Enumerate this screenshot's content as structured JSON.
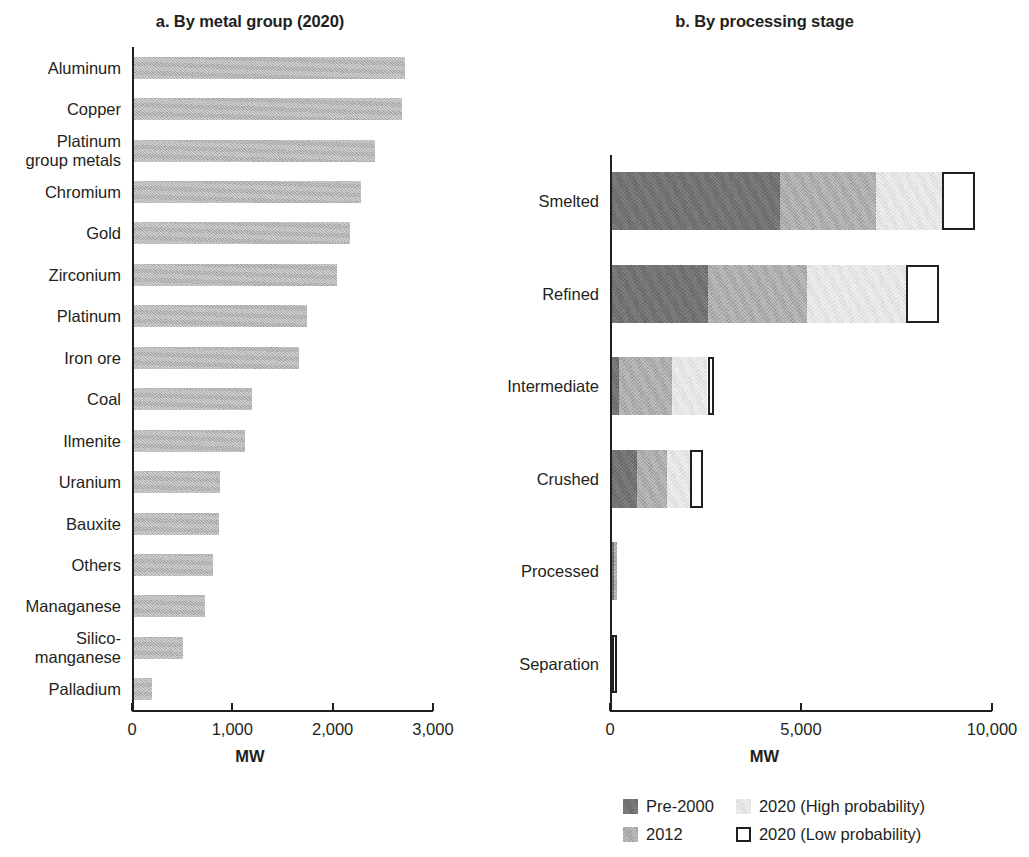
{
  "chart_data": [
    {
      "type": "bar",
      "panel": "a",
      "title": "a. By metal group (2020)",
      "orientation": "horizontal",
      "xlabel": "MW",
      "ylabel": "",
      "xlim": [
        0,
        3000
      ],
      "xticks": [
        0,
        1000,
        2000,
        3000
      ],
      "xticklabels": [
        "0",
        "1,000",
        "2,000",
        "3,000"
      ],
      "grid": false,
      "legend": "none",
      "categories": [
        "Aluminum",
        "Copper",
        "Platinum\ngroup metals",
        "Chromium",
        "Gold",
        "Zirconium",
        "Platinum",
        "Iron ore",
        "Coal",
        "Ilmenite",
        "Uranium",
        "Bauxite",
        "Others",
        "Managanese",
        "Silico-\nmanganese",
        "Palladium"
      ],
      "values": [
        2700,
        2670,
        2400,
        2260,
        2150,
        2020,
        1720,
        1640,
        1180,
        1110,
        860,
        850,
        790,
        710,
        490,
        180
      ],
      "series_color": "#b0b0b0"
    },
    {
      "type": "bar",
      "panel": "b",
      "title": "b. By processing stage",
      "orientation": "horizontal",
      "stacked": true,
      "xlabel": "MW",
      "ylabel": "",
      "xlim": [
        0,
        10000
      ],
      "xticks": [
        0,
        5000,
        10000
      ],
      "xticklabels": [
        "0",
        "5,000",
        "10,000"
      ],
      "grid": false,
      "legend_position": "bottom",
      "categories": [
        "Smelted",
        "Refined",
        "Intermediate",
        "Crushed",
        "Processed",
        "Separation"
      ],
      "series": [
        {
          "name": "Pre-2000",
          "color": "#6d6d6d",
          "values": [
            4400,
            2500,
            180,
            650,
            60,
            0
          ]
        },
        {
          "name": "2012",
          "color": "#a8a8a8",
          "values": [
            2500,
            2600,
            1400,
            800,
            70,
            0
          ]
        },
        {
          "name": "2020 (High probability)",
          "color": "#e2e2e2",
          "values": [
            1750,
            2600,
            920,
            580,
            0,
            0
          ]
        },
        {
          "name": "2020 (Low probability)",
          "color": "#ffffff",
          "values": [
            850,
            850,
            180,
            340,
            0,
            120
          ]
        }
      ]
    }
  ],
  "panel_a": {
    "title": "a. By metal group (2020)",
    "axis_title": "MW",
    "ticks": [
      "0",
      "1,000",
      "2,000",
      "3,000"
    ],
    "rows": [
      {
        "label": "Aluminum",
        "value": 2700
      },
      {
        "label": "Copper",
        "value": 2670
      },
      {
        "label": "Platinum\ngroup metals",
        "value": 2400
      },
      {
        "label": "Chromium",
        "value": 2260
      },
      {
        "label": "Gold",
        "value": 2150
      },
      {
        "label": "Zirconium",
        "value": 2020
      },
      {
        "label": "Platinum",
        "value": 1720
      },
      {
        "label": "Iron ore",
        "value": 1640
      },
      {
        "label": "Coal",
        "value": 1180
      },
      {
        "label": "Ilmenite",
        "value": 1110
      },
      {
        "label": "Uranium",
        "value": 860
      },
      {
        "label": "Bauxite",
        "value": 850
      },
      {
        "label": "Others",
        "value": 790
      },
      {
        "label": "Managanese",
        "value": 710
      },
      {
        "label": "Silico-\nmanganese",
        "value": 490
      },
      {
        "label": "Palladium",
        "value": 180
      }
    ]
  },
  "panel_b": {
    "title": "b. By processing stage",
    "axis_title": "MW",
    "ticks": [
      "0",
      "5,000",
      "10,000"
    ],
    "rows": [
      {
        "label": "Smelted",
        "pre2000": 4400,
        "y2012": 2500,
        "high2020": 1750,
        "low2020": 850
      },
      {
        "label": "Refined",
        "pre2000": 2500,
        "y2012": 2600,
        "high2020": 2600,
        "low2020": 850
      },
      {
        "label": "Intermediate",
        "pre2000": 180,
        "y2012": 1400,
        "high2020": 920,
        "low2020": 180
      },
      {
        "label": "Crushed",
        "pre2000": 650,
        "y2012": 800,
        "high2020": 580,
        "low2020": 340
      },
      {
        "label": "Processed",
        "pre2000": 60,
        "y2012": 70,
        "high2020": 0,
        "low2020": 0
      },
      {
        "label": "Separation",
        "pre2000": 0,
        "y2012": 0,
        "high2020": 0,
        "low2020": 120
      }
    ]
  },
  "legend": {
    "items": [
      {
        "label": "Pre-2000",
        "color": "#6d6d6d",
        "style": "fill"
      },
      {
        "label": "2020 (High probability)",
        "color": "#e2e2e2",
        "style": "fill"
      },
      {
        "label": "2012",
        "color": "#a8a8a8",
        "style": "fill"
      },
      {
        "label": "2020 (Low probability)",
        "color": "#ffffff",
        "style": "outline"
      }
    ]
  }
}
